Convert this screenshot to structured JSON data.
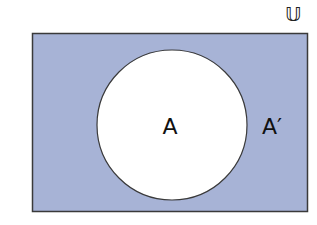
{
  "diagram": {
    "universe_label": "𝕌",
    "set_label": "A",
    "complement_label": "A′",
    "colors": {
      "universe_fill": "#a7b3d6",
      "set_fill": "#ffffff",
      "border": "#3a3a3a",
      "text": "#111111"
    }
  }
}
